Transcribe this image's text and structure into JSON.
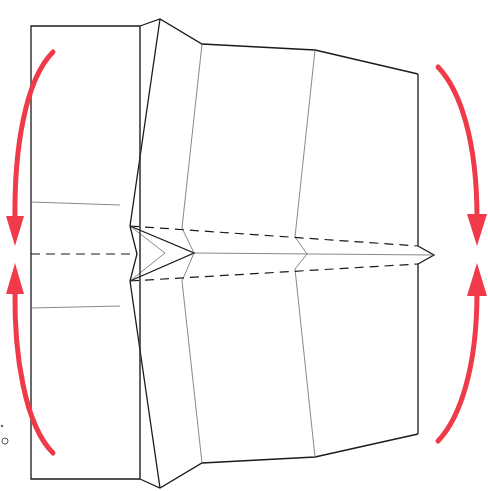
{
  "diagram": {
    "colors": {
      "paper_edge": "#1a1a1a",
      "crease": "#555555",
      "arrow": "#f03a4a",
      "background": "#ffffff"
    },
    "arrows": [
      {
        "id": "left-top",
        "direction": "down",
        "label": "fold top-left edge down to center"
      },
      {
        "id": "left-bottom",
        "direction": "up",
        "label": "fold bottom-left edge up to center"
      },
      {
        "id": "right-top",
        "direction": "down",
        "label": "fold top-right edge down to center"
      },
      {
        "id": "right-bottom",
        "direction": "up",
        "label": "fold bottom-right edge up to center"
      }
    ],
    "fold_lines": [
      {
        "type": "valley",
        "style": "dashed",
        "position": "upper"
      },
      {
        "type": "valley",
        "style": "dashed",
        "position": "center"
      },
      {
        "type": "valley",
        "style": "dashed",
        "position": "lower"
      }
    ],
    "margin_marks": {
      "dot": ".",
      "circle": "o"
    }
  }
}
